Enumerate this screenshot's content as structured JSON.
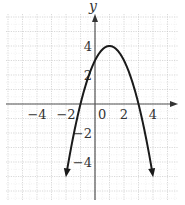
{
  "chart_data": {
    "type": "line",
    "title": "",
    "xlabel": "",
    "ylabel": "y",
    "function": "y = -x^2 + 2x + 3",
    "xlim": [
      -6,
      6
    ],
    "ylim": [
      -6.5,
      6
    ],
    "grid": true,
    "x_ticks": [
      -4,
      -2,
      0,
      2,
      4
    ],
    "y_ticks": [
      4,
      2,
      -2,
      -4
    ],
    "x_tick_labels": [
      "−4",
      "−2",
      "0",
      "2",
      "4"
    ],
    "y_tick_labels": [
      "4",
      "2",
      "−2",
      "−4"
    ],
    "vertex": [
      1,
      4
    ],
    "y_intercept": 3,
    "x_intercepts": [
      -1,
      3
    ],
    "series": [
      {
        "name": "parabola",
        "x": [
          -1.9,
          -1.5,
          -1,
          -0.5,
          0,
          0.5,
          1,
          1.5,
          2,
          2.5,
          3,
          3.5,
          3.9
        ],
        "values": [
          -5.41,
          -3.25,
          0,
          1.75,
          3,
          3.75,
          4,
          3.75,
          3,
          1.75,
          0,
          -2.25,
          -4.41
        ]
      }
    ],
    "arrows_at_ends": true
  }
}
